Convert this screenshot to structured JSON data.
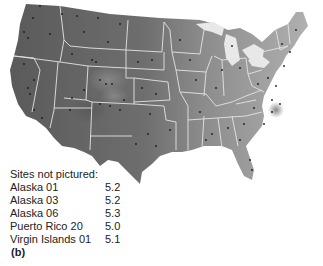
{
  "map": {
    "region": "Contiguous United States",
    "style": "grayscale shaded surface with state boundaries and site markers",
    "colors": {
      "west_dark": "#5f5f5f",
      "east_light": "#a8a8a8",
      "boundary": "#e6e6e6",
      "site_marker": "#1a1a1a",
      "background": "#ffffff"
    }
  },
  "legend": {
    "title": "Sites not pictured:",
    "sites": [
      {
        "name": "Alaska 01",
        "value": "5.2"
      },
      {
        "name": "Alaska 03",
        "value": "5.2"
      },
      {
        "name": "Alaska 06",
        "value": "5.3"
      },
      {
        "name": "Puerto Rico 20",
        "value": "5.0"
      },
      {
        "name": "Virgin Islands 01",
        "value": "5.1"
      }
    ]
  },
  "panel_label": "(b)"
}
